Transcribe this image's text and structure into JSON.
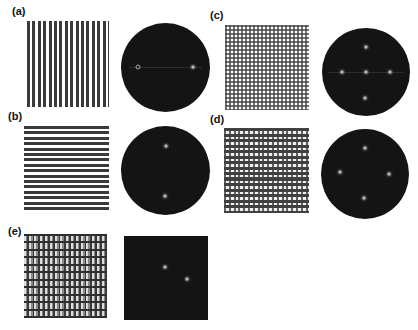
{
  "figure": {
    "panels": [
      {
        "id": "a",
        "label": "(a)",
        "pattern": "vertical stripes",
        "fft_shape": "circle",
        "fft_spots": [
          [
            -0.63,
            0
          ],
          [
            0.63,
            0
          ]
        ]
      },
      {
        "id": "b",
        "label": "(b)",
        "pattern": "horizontal stripes",
        "fft_shape": "circle",
        "fft_spots": [
          [
            0,
            -0.58
          ],
          [
            0,
            0.58
          ]
        ]
      },
      {
        "id": "c",
        "label": "(c)",
        "pattern": "checkerboard grid",
        "fft_shape": "circle",
        "fft_spots": [
          [
            0,
            0
          ],
          [
            -0.56,
            0
          ],
          [
            0.56,
            0
          ],
          [
            0,
            -0.56
          ],
          [
            0,
            0.6
          ]
        ]
      },
      {
        "id": "d",
        "label": "(d)",
        "pattern": "dense grid",
        "fft_shape": "circle",
        "fft_spots": [
          [
            0,
            -0.56
          ],
          [
            -0.56,
            0
          ],
          [
            0.56,
            0
          ],
          [
            0,
            0.56
          ]
        ]
      },
      {
        "id": "e",
        "label": "(e)",
        "pattern": "woven texture",
        "fft_shape": "square",
        "fft_spots": [
          [
            0,
            0
          ],
          [
            0.55,
            0.3
          ]
        ]
      }
    ]
  }
}
